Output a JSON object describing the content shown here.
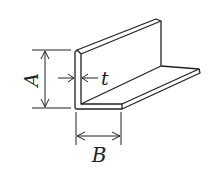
{
  "diagram": {
    "labels": {
      "height": "A",
      "width": "B",
      "thickness": "t"
    },
    "colors": {
      "stroke": "#222222",
      "background": "#ffffff"
    }
  }
}
